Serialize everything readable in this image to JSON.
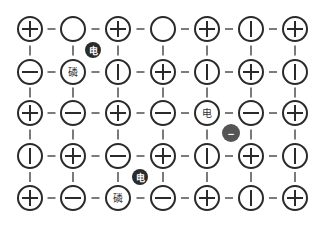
{
  "diagram": {
    "type": "grid-network",
    "rows": 5,
    "cols": 7,
    "col_x": [
      30,
      73,
      118,
      163,
      207,
      251,
      295
    ],
    "row_y": [
      29,
      72,
      113,
      156,
      198
    ],
    "node_radius": 12,
    "colors": {
      "stroke": "#2a2a2a",
      "dot_dark": "#2b2b2b",
      "dot_gray": "#555555",
      "background": "#ffffff"
    },
    "grid": [
      [
        "plus",
        "empty",
        "plus",
        "empty",
        "plus",
        "bar",
        "plus"
      ],
      [
        "minus",
        "text:磷",
        "bar",
        "plus",
        "bar",
        "plus",
        "bar"
      ],
      [
        "plus",
        "minus",
        "plus",
        "minus",
        "text:电",
        "minus",
        "plus"
      ],
      [
        "bar",
        "plus",
        "minus",
        "plus",
        "bar",
        "plus",
        "bar"
      ],
      [
        "plus",
        "minus",
        "text:磷",
        "minus",
        "plus",
        "bar",
        "plus"
      ]
    ],
    "floating_dots": [
      {
        "x": 93,
        "y": 50,
        "r": 8,
        "label": "电",
        "color": "#2b2b2b"
      },
      {
        "x": 140,
        "y": 177,
        "r": 8,
        "label": "电",
        "color": "#2b2b2b"
      },
      {
        "x": 231,
        "y": 133,
        "r": 9,
        "label": "−",
        "color": "#555555"
      }
    ]
  }
}
